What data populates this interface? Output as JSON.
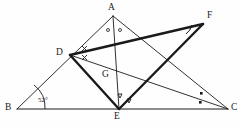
{
  "figure": {
    "type": "geometry-diagram",
    "caption": "Triangle ABC with cevians, bisector marks and external point F",
    "background_color": "#fefefe",
    "stroke_color": "#1a1a1a",
    "thin_width": 0.9,
    "thick_width": 2.4
  },
  "points": [
    {
      "id": "A",
      "label": "A",
      "x": 113,
      "y": 16,
      "label_x": 108,
      "label_y": 3
    },
    {
      "id": "B",
      "label": "B",
      "x": 17,
      "y": 109,
      "label_x": 5,
      "label_y": 103
    },
    {
      "id": "C",
      "label": "C",
      "x": 228,
      "y": 109,
      "label_x": 231,
      "label_y": 103
    },
    {
      "id": "D",
      "label": "D",
      "x": 70,
      "y": 55,
      "label_x": 56,
      "label_y": 48
    },
    {
      "id": "E",
      "label": "E",
      "x": 119,
      "y": 109,
      "label_x": 114,
      "label_y": 112
    },
    {
      "id": "F",
      "label": "F",
      "x": 203,
      "y": 24,
      "label_x": 207,
      "label_y": 11
    },
    {
      "id": "G",
      "label": "G",
      "x": 110,
      "y": 76,
      "label_x": 102,
      "label_y": 70
    }
  ],
  "segments": [
    {
      "name": "side-AB",
      "from": "A",
      "to": "B",
      "weight": "thin"
    },
    {
      "name": "side-BC",
      "from": "B",
      "to": "C",
      "weight": "thin"
    },
    {
      "name": "side-AC",
      "from": "A",
      "to": "C",
      "weight": "thin"
    },
    {
      "name": "cevian-AE",
      "from": "A",
      "to": "E",
      "weight": "thin"
    },
    {
      "name": "cevian-DC",
      "from": "D",
      "to": "C",
      "weight": "thin"
    },
    {
      "name": "segment-DF",
      "from": "D",
      "to": "F",
      "weight": "thick"
    },
    {
      "name": "segment-DE",
      "from": "D",
      "to": "E",
      "weight": "thick"
    },
    {
      "name": "segment-EF",
      "from": "E",
      "to": "F",
      "weight": "thick"
    }
  ],
  "angle_labels": [
    {
      "name": "angle-B",
      "text": "52°",
      "x": 38,
      "y": 97
    }
  ],
  "angle_marks": [
    {
      "name": "angle-mark-A-left",
      "kind": "circle",
      "vertex": "A"
    },
    {
      "name": "angle-mark-A-right",
      "kind": "circle",
      "vertex": "A"
    },
    {
      "name": "angle-mark-D-upper",
      "kind": "cross",
      "vertex": "D"
    },
    {
      "name": "angle-mark-D-lower",
      "kind": "cross",
      "vertex": "D"
    },
    {
      "name": "angle-mark-E-left",
      "kind": "triangle",
      "vertex": "E"
    },
    {
      "name": "angle-mark-E-right",
      "kind": "triangle",
      "vertex": "E"
    },
    {
      "name": "angle-mark-C-upper",
      "kind": "square",
      "vertex": "C"
    },
    {
      "name": "angle-mark-C-lower",
      "kind": "square",
      "vertex": "C"
    },
    {
      "name": "angle-mark-F",
      "kind": "arc",
      "vertex": "F"
    },
    {
      "name": "angle-arc-B",
      "kind": "arc",
      "vertex": "B"
    }
  ]
}
